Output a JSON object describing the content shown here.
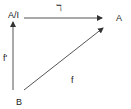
{
  "diagram": {
    "nodes": {
      "quotient": "A/I",
      "target": "A",
      "source": "B"
    },
    "arrows": {
      "top": "ℸ",
      "left": "f'",
      "diagonal": "f"
    }
  }
}
